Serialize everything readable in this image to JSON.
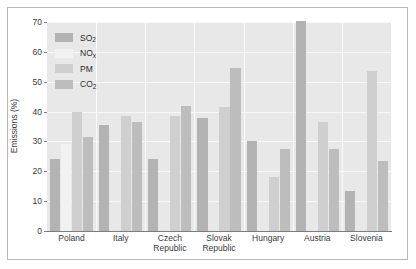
{
  "chart_data": {
    "type": "bar",
    "title": "",
    "subtitle": "",
    "xlabel": "",
    "ylabel": "Emissions (%)",
    "ylim": [
      0,
      70
    ],
    "ytick_labels": [
      "0",
      "10",
      "20",
      "30",
      "40",
      "50",
      "60",
      "70"
    ],
    "ytick_values": [
      0,
      10,
      20,
      30,
      40,
      50,
      60,
      70
    ],
    "grid": true,
    "grid_axis": "y",
    "legend_position": "top-left inside plot",
    "categories": [
      "Poland",
      "Italy",
      "Czech Republic",
      "Slovak Republic",
      "Hungary",
      "Austria",
      "Slovenia"
    ],
    "category_lines": [
      [
        "Poland"
      ],
      [
        "Italy"
      ],
      [
        "Czech",
        "Republic"
      ],
      [
        "Slovak",
        "Republic"
      ],
      [
        "Hungary"
      ],
      [
        "Austria"
      ],
      [
        "Slovenia"
      ]
    ],
    "series": [
      {
        "name": "SO2",
        "label_main": "SO",
        "label_sub": "2",
        "color": "#b3b3b3",
        "values": [
          24,
          35.5,
          24,
          38,
          30,
          70.5,
          13.5
        ]
      },
      {
        "name": "NOx",
        "label_main": "NO",
        "label_sub": "x",
        "color": "#f2f2f2",
        "values": [
          29,
          0,
          0,
          0,
          0,
          0,
          0
        ]
      },
      {
        "name": "PM",
        "label_main": "PM",
        "label_sub": "",
        "color": "#cfcfcf",
        "values": [
          40,
          38.5,
          38.5,
          41.5,
          18,
          36.5,
          53.5
        ]
      },
      {
        "name": "CO2",
        "label_main": "CO",
        "label_sub": "2",
        "color": "#bdbdbd",
        "values": [
          31.5,
          36.5,
          42,
          54.5,
          27.5,
          27.5,
          23.5
        ]
      }
    ]
  },
  "style": {
    "plot_background": "#e8e8e8",
    "gridline_color": "#f8f8f8",
    "axis_color": "#7d7d7d",
    "frame_color": "#b9b9b9",
    "text_color": "#3a3a3a",
    "page_background": "#ffffff"
  }
}
